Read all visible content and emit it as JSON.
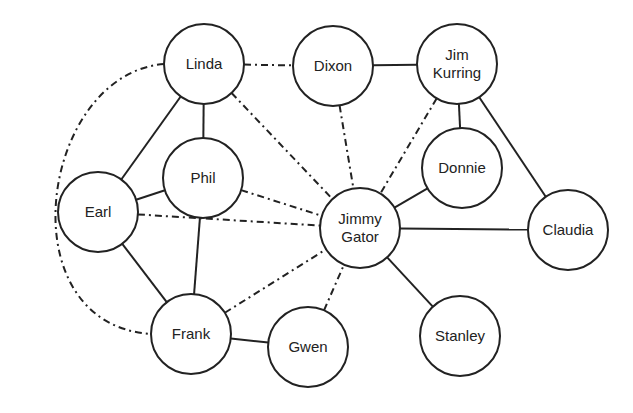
{
  "diagram": {
    "type": "social-network-graph",
    "colors": {
      "line": "#222222",
      "text": "#222222",
      "node_fill": "#ffffff",
      "background": "#ffffff"
    },
    "node_radius": 40,
    "nodes": [
      {
        "id": "linda",
        "label": [
          "Linda"
        ],
        "x": 204,
        "y": 64
      },
      {
        "id": "dixon",
        "label": [
          "Dixon"
        ],
        "x": 333,
        "y": 66
      },
      {
        "id": "jim",
        "label": [
          "Jim",
          "Kurring"
        ],
        "x": 457,
        "y": 64
      },
      {
        "id": "phil",
        "label": [
          "Phil"
        ],
        "x": 203,
        "y": 178
      },
      {
        "id": "earl",
        "label": [
          "Earl"
        ],
        "x": 98,
        "y": 212
      },
      {
        "id": "donnie",
        "label": [
          "Donnie"
        ],
        "x": 462,
        "y": 168
      },
      {
        "id": "jimmy",
        "label": [
          "Jimmy",
          "Gator"
        ],
        "x": 360,
        "y": 228
      },
      {
        "id": "claudia",
        "label": [
          "Claudia"
        ],
        "x": 568,
        "y": 230
      },
      {
        "id": "frank",
        "label": [
          "Frank"
        ],
        "x": 191,
        "y": 334
      },
      {
        "id": "gwen",
        "label": [
          "Gwen"
        ],
        "x": 308,
        "y": 347
      },
      {
        "id": "stanley",
        "label": [
          "Stanley"
        ],
        "x": 460,
        "y": 336
      }
    ],
    "edges": [
      {
        "from": "linda",
        "to": "phil",
        "style": "solid"
      },
      {
        "from": "linda",
        "to": "earl",
        "style": "solid"
      },
      {
        "from": "earl",
        "to": "phil",
        "style": "solid"
      },
      {
        "from": "earl",
        "to": "frank",
        "style": "solid"
      },
      {
        "from": "phil",
        "to": "frank",
        "style": "solid"
      },
      {
        "from": "frank",
        "to": "gwen",
        "style": "solid"
      },
      {
        "from": "dixon",
        "to": "jim",
        "style": "solid"
      },
      {
        "from": "jim",
        "to": "donnie",
        "style": "solid"
      },
      {
        "from": "jim",
        "to": "claudia",
        "style": "solid"
      },
      {
        "from": "donnie",
        "to": "jimmy",
        "style": "solid"
      },
      {
        "from": "jimmy",
        "to": "claudia",
        "style": "solid"
      },
      {
        "from": "jimmy",
        "to": "stanley",
        "style": "solid"
      },
      {
        "from": "linda",
        "to": "dixon",
        "style": "dashdot"
      },
      {
        "from": "linda",
        "to": "jimmy",
        "style": "dashdot"
      },
      {
        "from": "dixon",
        "to": "jimmy",
        "style": "dashdot"
      },
      {
        "from": "jim",
        "to": "jimmy",
        "style": "dashdot"
      },
      {
        "from": "phil",
        "to": "jimmy",
        "style": "dashdot"
      },
      {
        "from": "earl",
        "to": "jimmy",
        "style": "dashdot"
      },
      {
        "from": "frank",
        "to": "jimmy",
        "style": "dashdot"
      },
      {
        "from": "gwen",
        "to": "jimmy",
        "style": "dashdot"
      },
      {
        "from": "linda",
        "to": "frank",
        "style": "dashdot-arc"
      }
    ]
  }
}
